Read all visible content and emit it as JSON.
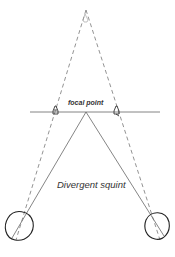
{
  "diagram": {
    "title": "Divergent squint",
    "labels": {
      "focal_point": "focal point",
      "caption": "Divergent squint"
    },
    "colors": {
      "line": "#555555",
      "dashed": "#777777",
      "eye": "#222222",
      "background": "#ffffff"
    },
    "elements": {
      "dashed_apex": {
        "x": 86,
        "y": 10
      },
      "horizontal_line": {
        "x1": 30,
        "x2": 160,
        "y": 112
      },
      "focal_point": {
        "x": 86,
        "y": 112
      },
      "left_object": {
        "x": 56,
        "y": 112
      },
      "right_object": {
        "x": 116,
        "y": 112
      },
      "left_eye": {
        "cx": 18,
        "cy": 226,
        "r": 15
      },
      "right_eye": {
        "cx": 157,
        "cy": 226,
        "r": 13
      }
    }
  }
}
